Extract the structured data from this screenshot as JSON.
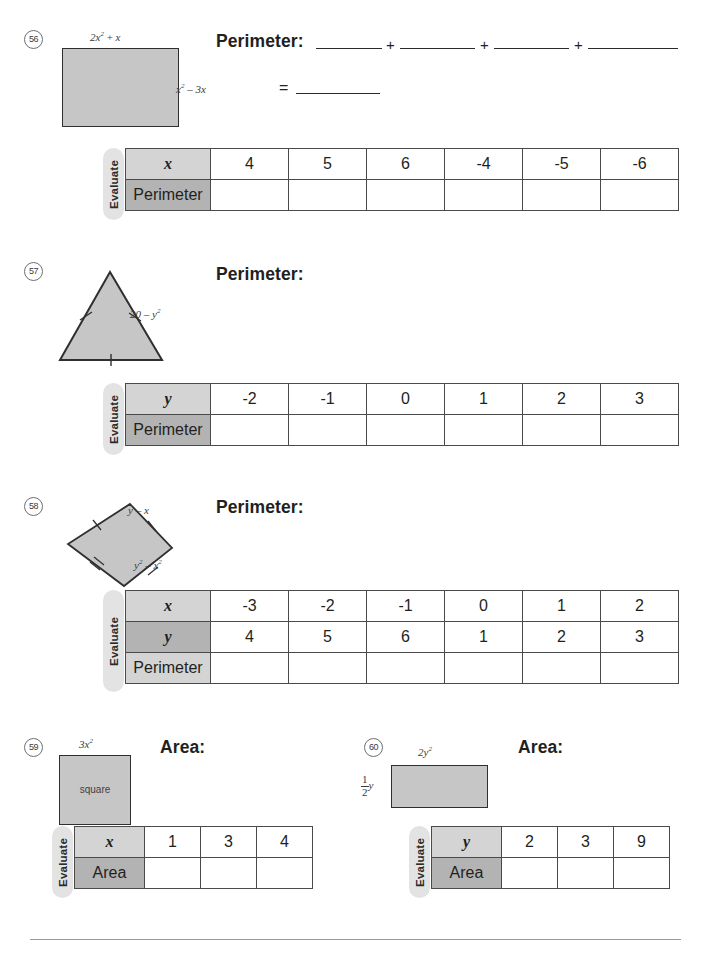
{
  "worksheet": {
    "problems": [
      {
        "number": "56",
        "prompt": "Perimeter:",
        "equals": "=",
        "plus": "+",
        "shape": "rectangle",
        "labels": {
          "top": "2x² + x",
          "right": "x² − 3x"
        },
        "blank_count": 4,
        "table": {
          "eval_label": "Evaluate",
          "rows": [
            {
              "label": "x",
              "style": "var",
              "values": [
                "4",
                "5",
                "6",
                "-4",
                "-5",
                "-6"
              ]
            },
            {
              "label": "Perimeter",
              "style": "dark",
              "values": [
                "",
                "",
                "",
                "",
                "",
                ""
              ]
            }
          ]
        }
      },
      {
        "number": "57",
        "prompt": "Perimeter:",
        "shape": "equilateral-triangle",
        "labels": {
          "side": "20 − y²"
        },
        "table": {
          "eval_label": "Evaluate",
          "rows": [
            {
              "label": "y",
              "style": "var",
              "values": [
                "-2",
                "-1",
                "0",
                "1",
                "2",
                "3"
              ]
            },
            {
              "label": "Perimeter",
              "style": "dark",
              "values": [
                "",
                "",
                "",
                "",
                "",
                ""
              ]
            }
          ]
        }
      },
      {
        "number": "58",
        "prompt": "Perimeter:",
        "shape": "kite",
        "labels": {
          "upper_side": "y − x",
          "lower_side": "y² − x²"
        },
        "table": {
          "eval_label": "Evaluate",
          "rows": [
            {
              "label": "x",
              "style": "var-light",
              "values": [
                "-3",
                "-2",
                "-1",
                "0",
                "1",
                "2"
              ]
            },
            {
              "label": "y",
              "style": "var-dark",
              "values": [
                "4",
                "5",
                "6",
                "1",
                "2",
                "3"
              ]
            },
            {
              "label": "Perimeter",
              "style": "dark",
              "values": [
                "",
                "",
                "",
                "",
                "",
                ""
              ]
            }
          ]
        }
      },
      {
        "number": "59",
        "prompt": "Area:",
        "shape": "square",
        "labels": {
          "top": "3x²",
          "inside": "square"
        },
        "table": {
          "eval_label": "Evaluate",
          "rows": [
            {
              "label": "x",
              "style": "var",
              "values": [
                "1",
                "3",
                "4"
              ]
            },
            {
              "label": "Area",
              "style": "dark",
              "values": [
                "",
                "",
                ""
              ]
            }
          ]
        }
      },
      {
        "number": "60",
        "prompt": "Area:",
        "shape": "rectangle",
        "labels": {
          "top": "2y²",
          "left_fraction_numerator": "1",
          "left_fraction_denominator": "2",
          "left_fraction_variable": "y"
        },
        "table": {
          "eval_label": "Evaluate",
          "rows": [
            {
              "label": "y",
              "style": "var",
              "values": [
                "2",
                "3",
                "9"
              ]
            },
            {
              "label": "Area",
              "style": "dark",
              "values": [
                "",
                "",
                ""
              ]
            }
          ]
        }
      }
    ],
    "colors": {
      "shape_fill": "#c6c6c6",
      "shape_stroke": "#2f2f2f",
      "header_light": "#d4d4d4",
      "header_dark": "#b3b3b3",
      "pill": "#e3e3e3"
    }
  }
}
